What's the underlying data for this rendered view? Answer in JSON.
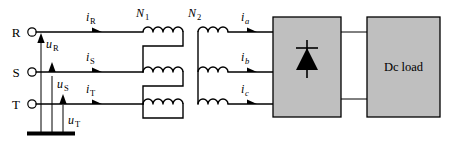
{
  "figure": {
    "background_color": "#ffffff",
    "line_color": "#000000",
    "block_fill_color": "#bfbfbf",
    "block_stroke_color": "#000000"
  },
  "source_terminals": [
    {
      "label": "R",
      "name": "terminal-r"
    },
    {
      "label": "S",
      "name": "terminal-s"
    },
    {
      "label": "T",
      "name": "terminal-t"
    }
  ],
  "source_voltages": [
    {
      "base": "u",
      "sub": "R"
    },
    {
      "base": "u",
      "sub": "S"
    },
    {
      "base": "u",
      "sub": "T"
    }
  ],
  "primary_currents": [
    {
      "base": "i",
      "sub": "R"
    },
    {
      "base": "i",
      "sub": "S"
    },
    {
      "base": "i",
      "sub": "T"
    }
  ],
  "secondary_currents": [
    {
      "base": "i",
      "sub": "a"
    },
    {
      "base": "i",
      "sub": "b"
    },
    {
      "base": "i",
      "sub": "c"
    }
  ],
  "windings": {
    "primary": {
      "base": "N",
      "sub": "1"
    },
    "secondary": {
      "base": "N",
      "sub": "2"
    }
  },
  "blocks": {
    "rectifier": {
      "label": "",
      "icon": "diode-icon"
    },
    "load": {
      "label": "Dc load"
    }
  }
}
